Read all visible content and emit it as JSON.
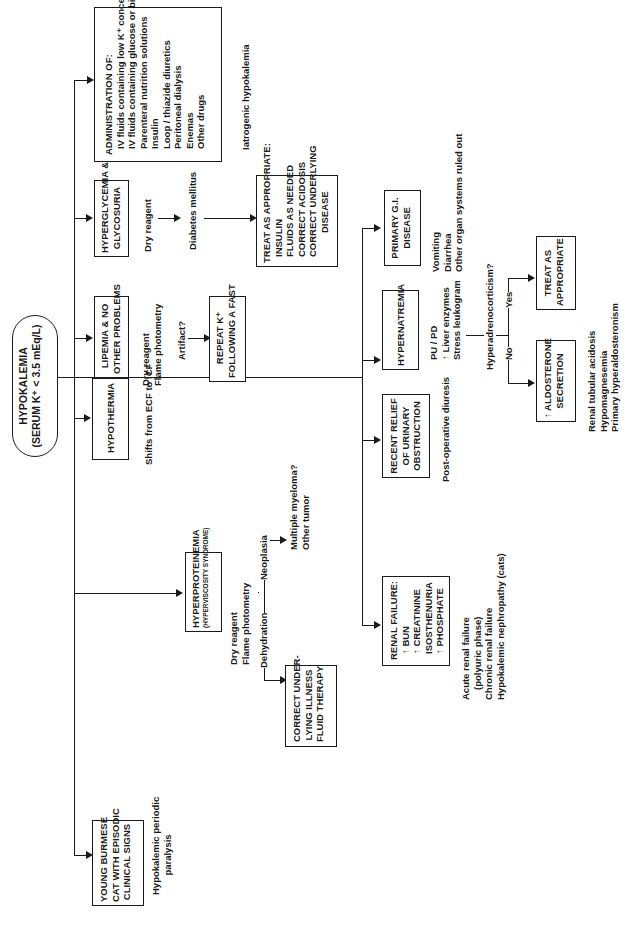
{
  "root": {
    "title": "HYPOKALEMIA",
    "subtitle": "(SERUM K⁺ < 3.5 mEq/L)"
  },
  "left_branches": {
    "administration": {
      "heading": "ADMINISTRATION OF:",
      "items": [
        "IV fluids containing low K⁺ concentrations",
        "IV fluids containing glucose or bicarbonate",
        "Parenteral nutrition solutions",
        "Insulin",
        "Loop / thiazide diuretics",
        "Peritoneal dialysis",
        "Enemas",
        "Other drugs"
      ],
      "note": "Iatrogenic hypokalemia"
    },
    "hyperglycemia": {
      "label_line1": "HYPERGLYCEMIA &",
      "label_line2": "GLYCOSURIA",
      "step1": "Dry reagent",
      "step2": "Diabetes mellitus",
      "treat": {
        "heading": "TREAT AS APPROPRIATE:",
        "items": [
          "INSULIN",
          "FLUIDS AS NEEDED",
          "CORRECT ACIDOSIS",
          "CORRECT UNDERLYING",
          "DISEASE"
        ]
      }
    },
    "lipemia": {
      "label_line1": "LIPEMIA & NO",
      "label_line2": "OTHER PROBLEMS",
      "method1": "Dry reagent",
      "method2": "Flame photometry",
      "question": "Artifact?",
      "repeat_line1": "REPEAT K⁺",
      "repeat_line2": "FOLLOWING A FAST"
    },
    "hypothermia": {
      "label": "HYPOTHERMIA",
      "note": "Shifts from ECF to ICF"
    },
    "hyperproteinemia": {
      "label": "HYPERPROTEINEMIA",
      "sublabel": "(HYPERVISCOSITY SYNDROME)",
      "method1": "Dry reagent",
      "method2": "Flame photometry",
      "neoplasia_label": "Neoplasia",
      "neoplasia_result1": "Multiple myeloma?",
      "neoplasia_result2": "Other tumor",
      "dehydration_label": "Dehydration",
      "correct_line1": "CORRECT UNDER-",
      "correct_line2": "LYING ILLNESS",
      "correct_line3": "FLUID THERAPY"
    },
    "young_burmese": {
      "label_line1": "YOUNG BURMESE",
      "label_line2": "CAT WITH EPISODIC",
      "label_line3": "CLINICAL SIGNS",
      "note_line1": "Hypokalemic periodic",
      "note_line2": "paralysis"
    }
  },
  "right_branches": {
    "primary_gi": {
      "label_line1": "PRIMARY G.I.",
      "label_line2": "DISEASE",
      "notes": [
        "Vomiting",
        "Diarrhea",
        "Other organ systems ruled out"
      ]
    },
    "hypernatremia": {
      "label": "HYPERNATREMIA",
      "notes": [
        "PU / PD",
        "↑ Liver enzymes",
        "Stress leukogram"
      ],
      "question": "Hyperadrenocorticism?",
      "yes_label": "Yes",
      "no_label": "No",
      "yes_result_line1": "TREAT AS",
      "yes_result_line2": "APPROPRIATE",
      "no_result_line1": "↑ ALDOSTERONE",
      "no_result_line2": "SECRETION",
      "no_notes": [
        "Renal tubular acidosis",
        "Hypomagnesemia",
        "Primary hyperaldosteronism"
      ]
    },
    "urinary_obstruction": {
      "label_line1": "RECENT RELIEF",
      "label_line2": "OF URINARY",
      "label_line3": "OBSTRUCTION",
      "note": "Post-operative diuresis"
    },
    "renal_failure": {
      "heading": "RENAL FAILURE:",
      "items": [
        "↑ BUN",
        "↑ CREATININE",
        "ISOSTHENURIA",
        "↑ PHOSPHATE"
      ],
      "notes": [
        "Acute renal failure",
        "(polyuric phase)",
        "Chronic renal failure",
        "Hypokalemic nephropathy (cats)"
      ]
    }
  }
}
